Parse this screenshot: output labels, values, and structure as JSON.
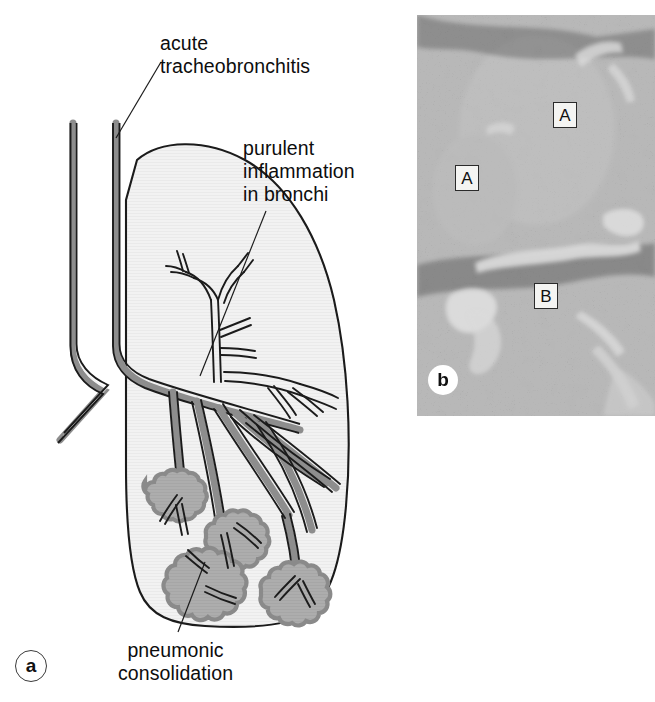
{
  "figure": {
    "panels": [
      {
        "id": "a",
        "letter": "a",
        "type": "schematic-diagram",
        "subject": "bronchopneumonia lung schematic"
      },
      {
        "id": "b",
        "letter": "b",
        "type": "histology-micrograph",
        "subject": "lung histology section"
      }
    ]
  },
  "diagram": {
    "callouts": [
      {
        "name": "acute-tracheobronchitis",
        "text": "acute\ntracheobronchitis",
        "leader_from": [
          161,
          62
        ],
        "leader_to": [
          116,
          138
        ]
      },
      {
        "name": "purulent-inflammation-in-bronchi",
        "text": "purulent\ninflammation\nin bronchi",
        "leader_from": [
          266,
          211
        ],
        "leader_to": [
          200,
          376
        ]
      },
      {
        "name": "pneumonic-consolidation",
        "text": "pneumonic\nconsolidation",
        "leader_from": [
          178,
          632
        ],
        "leader_to": [
          205,
          562
        ]
      }
    ],
    "colors": {
      "lung_fill": "#f1f1f1",
      "outline": "#1b1b1b",
      "airway_wall": "#8d8d8d",
      "airway_lumen": "#f4f4f4",
      "consolidation_fill": "#adadad",
      "consolidation_edge": "#8a8a8a",
      "text": "#0d0d0d"
    }
  },
  "histology": {
    "markers": [
      {
        "name": "marker-a-upper",
        "label": "A"
      },
      {
        "name": "marker-a-left",
        "label": "A"
      },
      {
        "name": "marker-b",
        "label": "B"
      }
    ],
    "panel_letter": "b",
    "colors": {
      "background": "#8d8d8d",
      "marker_box": "#f4f4f2",
      "marker_text": "#111111"
    }
  }
}
